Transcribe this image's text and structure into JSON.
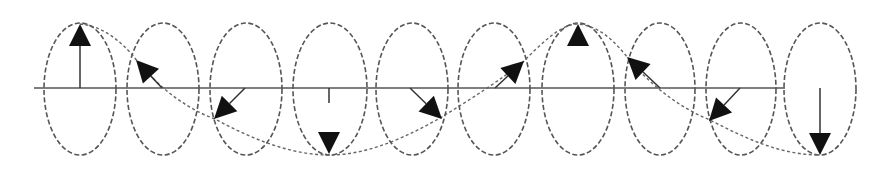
{
  "diagram": {
    "title": "",
    "colors": {
      "background": "#ffffff",
      "ellipse_stroke": "#555555",
      "axis_stroke": "#555555",
      "helix_stroke": "#666666",
      "arrow_fill": "#111111"
    },
    "axis": {
      "x1": 34,
      "x2": 785,
      "y": 88
    },
    "ellipses": [
      {
        "cx": 80,
        "cy": 89,
        "rx": 36,
        "ry": 66
      },
      {
        "cx": 163,
        "cy": 89,
        "rx": 36,
        "ry": 66
      },
      {
        "cx": 246,
        "cy": 89,
        "rx": 36,
        "ry": 66
      },
      {
        "cx": 330,
        "cy": 89,
        "rx": 37,
        "ry": 66
      },
      {
        "cx": 412,
        "cy": 89,
        "rx": 36,
        "ry": 66
      },
      {
        "cx": 494,
        "cy": 89,
        "rx": 36,
        "ry": 66
      },
      {
        "cx": 578,
        "cy": 89,
        "rx": 36,
        "ry": 66
      },
      {
        "cx": 660,
        "cy": 89,
        "rx": 35,
        "ry": 66
      },
      {
        "cx": 741,
        "cy": 89,
        "rx": 35,
        "ry": 66
      },
      {
        "cx": 820,
        "cy": 89,
        "rx": 36,
        "ry": 66
      }
    ],
    "arrows": [
      {
        "from": [
          80,
          88
        ],
        "to": [
          80,
          24
        ],
        "direction": "up"
      },
      {
        "from": [
          162,
          88
        ],
        "to": [
          136,
          60
        ],
        "direction": "up-left"
      },
      {
        "from": [
          245,
          88
        ],
        "to": [
          214,
          119
        ],
        "direction": "down-left"
      },
      {
        "from": [
          329,
          88
        ],
        "to": [
          329,
          154
        ],
        "direction": "down",
        "stem_visible_to": 103
      },
      {
        "from": [
          410,
          88
        ],
        "to": [
          442,
          119
        ],
        "direction": "down-right"
      },
      {
        "from": [
          495,
          88
        ],
        "to": [
          524,
          61
        ],
        "direction": "up-right"
      },
      {
        "from": [
          578,
          88
        ],
        "to": [
          578,
          24
        ],
        "direction": "up",
        "stem_visible_to": 46
      },
      {
        "from": [
          660,
          88
        ],
        "to": [
          627,
          57
        ],
        "direction": "up-left"
      },
      {
        "from": [
          740,
          88
        ],
        "to": [
          709,
          121
        ],
        "direction": "down-left"
      },
      {
        "from": [
          820,
          88
        ],
        "to": [
          820,
          155
        ],
        "direction": "down"
      }
    ],
    "helix_path": "M80,24 C105,26 125,45 138,62 C160,88 185,108 215,119 C250,138 290,155 329,155 C370,155 410,135 440,118 C470,100 500,80 522,63 C540,45 560,24 578,24 C600,26 615,42 628,58 C650,85 680,108 710,120 C745,138 780,155 820,155"
  }
}
